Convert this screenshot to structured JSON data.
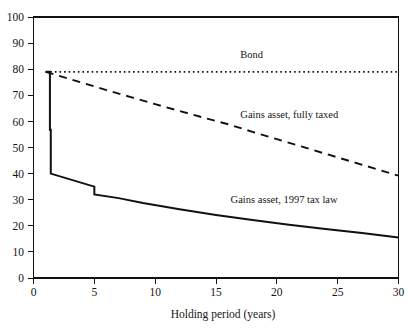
{
  "chart_data": {
    "type": "line",
    "title": "",
    "xlabel": "Holding period (years)",
    "ylabel": "",
    "xlim": [
      0,
      30
    ],
    "ylim": [
      0,
      100
    ],
    "grid": false,
    "legend_position": "inline-annotations",
    "x_ticks": [
      0,
      5,
      10,
      15,
      20,
      25,
      30
    ],
    "x_tick_labels": [
      "0",
      "5",
      "10",
      "15",
      "20",
      "25",
      "30"
    ],
    "y_ticks": [
      0,
      10,
      20,
      30,
      40,
      50,
      60,
      70,
      80,
      90,
      100
    ],
    "y_tick_labels": [
      "0",
      "10",
      "20",
      "30",
      "40",
      "50",
      "60",
      "70",
      "80",
      "90",
      "100"
    ],
    "series": [
      {
        "name": "Bond",
        "style": "dotted",
        "label": "Bond",
        "label_x": 17.0,
        "label_y": 84.5,
        "x": [
          1.0,
          2,
          4,
          6,
          8,
          10,
          12,
          14,
          16,
          18,
          20,
          22,
          24,
          26,
          28,
          30
        ],
        "values": [
          79,
          79,
          79,
          79,
          79,
          79,
          79,
          79,
          79,
          79,
          79,
          79,
          79,
          79,
          79,
          79
        ]
      },
      {
        "name": "Gains asset, fully taxed",
        "style": "dashed",
        "label": "Gains asset, fully taxed",
        "label_x": 17.0,
        "label_y": 61.5,
        "x": [
          1.0,
          2,
          3,
          4,
          5,
          6,
          8,
          10,
          12,
          14,
          16,
          18,
          20,
          22,
          24,
          26,
          28,
          30
        ],
        "values": [
          79,
          77.6,
          76.2,
          74.8,
          73.4,
          72.0,
          69.3,
          66.6,
          64.0,
          61.4,
          58.9,
          56.0,
          53.2,
          50.4,
          47.6,
          44.8,
          42.0,
          39.2
        ]
      },
      {
        "name": "Gains asset, 1997 tax law",
        "style": "solid-step",
        "label": "Gains asset, 1997 tax law",
        "label_x": 16.2,
        "label_y": 28.8,
        "x": [
          1.0,
          1.35,
          1.35,
          1.42,
          1.42,
          5.0,
          5.0,
          7,
          9,
          12,
          15,
          18,
          21,
          24,
          27,
          30
        ],
        "values": [
          79,
          79,
          56.8,
          56.8,
          40.0,
          35.0,
          32.0,
          30.6,
          28.7,
          26.3,
          24.1,
          22.2,
          20.4,
          18.8,
          17.2,
          15.5
        ]
      }
    ]
  }
}
